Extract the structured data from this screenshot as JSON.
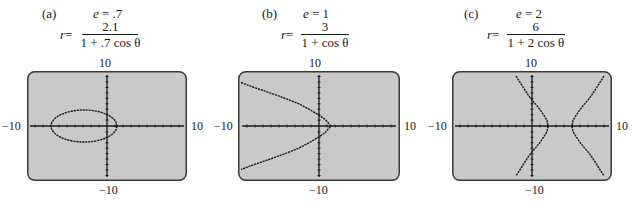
{
  "figures": [
    {
      "id": "a",
      "label": "(a)",
      "eccentricity": "e = .7",
      "e_sym": "e",
      "e_val": " = .7",
      "r_sym": "r",
      "eq_prefix": " =",
      "numerator": "2.1",
      "denominator": "1 + .7 cos θ",
      "window": {
        "xmin": "−10",
        "xmax": "10",
        "ymin": "−10",
        "ymax": "10"
      },
      "curve": "ellipse"
    },
    {
      "id": "b",
      "label": "(b)",
      "eccentricity": "e = 1",
      "e_sym": "e",
      "e_val": " = 1",
      "r_sym": "r",
      "eq_prefix": " =",
      "numerator": "3",
      "denominator": "1 + cos θ",
      "window": {
        "xmin": "−10",
        "xmax": "10",
        "ymin": "−10",
        "ymax": "10"
      },
      "curve": "parabola"
    },
    {
      "id": "c",
      "label": "(c)",
      "eccentricity": "e = 2",
      "e_sym": "e",
      "e_val": " = 2",
      "r_sym": "r",
      "eq_prefix": " =",
      "numerator": "6",
      "denominator": "1 + 2 cos θ",
      "window": {
        "xmin": "−10",
        "xmax": "10",
        "ymin": "−10",
        "ymax": "10"
      },
      "curve": "hyperbola"
    }
  ],
  "colors": {
    "screen_bg": "#c9c9c9",
    "screen_border": "#3a3a3a",
    "curve": "#1a1a1a",
    "axis": "#1a1a1a"
  }
}
